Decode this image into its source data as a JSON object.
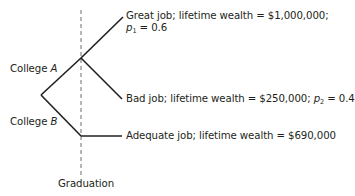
{
  "diagram": {
    "type": "decision-tree",
    "decision_node": {
      "branches": [
        {
          "id": "college-a",
          "label_prefix": "College ",
          "label_var": "A"
        },
        {
          "id": "college-b",
          "label_prefix": "College ",
          "label_var": "B"
        }
      ]
    },
    "outcomes": {
      "great": {
        "line1": "Great job; lifetime wealth = $1,000,000;",
        "prob_var": "p",
        "prob_sub": "1",
        "prob_rest": " = 0.6",
        "wealth": 1000000,
        "probability": 0.6
      },
      "bad": {
        "text": "Bad job; lifetime wealth = $250,000; ",
        "prob_var": "p",
        "prob_sub": "2",
        "prob_rest": " = 0.4",
        "wealth": 250000,
        "probability": 0.4
      },
      "adequate": {
        "text": "Adequate job; lifetime wealth = $690,000",
        "wealth": 690000
      }
    },
    "timeline_marker": {
      "label": "Graduation",
      "style": "dashed"
    },
    "colors": {
      "line": "#231f20",
      "dashed": "#6d6e71",
      "text": "#231f20"
    }
  }
}
